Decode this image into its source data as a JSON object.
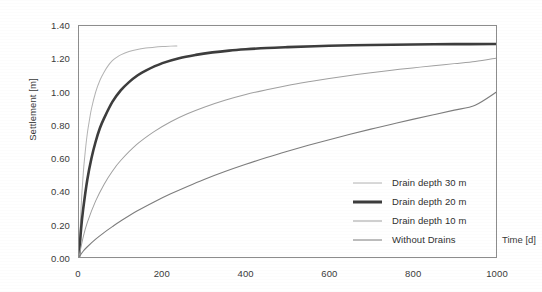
{
  "chart_data": {
    "type": "line",
    "title": "",
    "xlabel": "Time [d]",
    "ylabel": "Settlement [m]",
    "xlim": [
      0,
      1000
    ],
    "ylim": [
      0,
      1.4
    ],
    "xticks": [
      "0",
      "200",
      "400",
      "600",
      "800",
      "1000"
    ],
    "xtick_values": [
      0,
      200,
      400,
      600,
      800,
      1000
    ],
    "yticks": [
      "0.00",
      "0.20",
      "0.40",
      "0.60",
      "0.80",
      "1.00",
      "1.20",
      "1.40"
    ],
    "ytick_values": [
      0.0,
      0.2,
      0.4,
      0.6,
      0.8,
      1.0,
      1.2,
      1.4
    ],
    "grid": false,
    "legend_position": "lower right inside",
    "series": [
      {
        "name": "Drain depth 30 m",
        "color": "#b3b3b3",
        "width": 1.0,
        "x": [
          0,
          5,
          10,
          15,
          20,
          25,
          30,
          40,
          50,
          60,
          70,
          80,
          90,
          100,
          120,
          140,
          160,
          180,
          200,
          220,
          235
        ],
        "y": [
          0.0,
          0.3,
          0.5,
          0.64,
          0.75,
          0.83,
          0.9,
          1.0,
          1.07,
          1.12,
          1.16,
          1.19,
          1.21,
          1.225,
          1.245,
          1.258,
          1.266,
          1.271,
          1.275,
          1.278,
          1.279
        ]
      },
      {
        "name": "Drain depth 20 m",
        "color": "#3d3d3d",
        "width": 2.6,
        "x": [
          0,
          5,
          10,
          20,
          30,
          40,
          50,
          60,
          80,
          100,
          120,
          140,
          160,
          200,
          240,
          280,
          320,
          360,
          400,
          450,
          500,
          600,
          700,
          800,
          900,
          1000
        ],
        "y": [
          0.0,
          0.17,
          0.29,
          0.47,
          0.6,
          0.7,
          0.78,
          0.84,
          0.94,
          1.01,
          1.06,
          1.1,
          1.13,
          1.175,
          1.205,
          1.225,
          1.24,
          1.251,
          1.259,
          1.267,
          1.272,
          1.28,
          1.285,
          1.288,
          1.29,
          1.291
        ]
      },
      {
        "name": "Drain depth 10 m",
        "color": "#a0a0a0",
        "width": 1.0,
        "x": [
          0,
          10,
          20,
          40,
          60,
          80,
          100,
          140,
          180,
          220,
          260,
          300,
          350,
          400,
          450,
          500,
          550,
          600,
          650,
          700,
          750,
          800,
          850,
          900,
          950,
          1000
        ],
        "y": [
          0.0,
          0.12,
          0.21,
          0.34,
          0.44,
          0.52,
          0.585,
          0.685,
          0.76,
          0.82,
          0.868,
          0.908,
          0.95,
          0.985,
          1.014,
          1.04,
          1.062,
          1.082,
          1.1,
          1.117,
          1.132,
          1.146,
          1.159,
          1.172,
          1.185,
          1.205
        ]
      },
      {
        "name": "Without Drains",
        "color": "#7d7d7d",
        "width": 1.1,
        "x": [
          0,
          10,
          20,
          40,
          60,
          80,
          100,
          140,
          180,
          220,
          260,
          300,
          350,
          400,
          450,
          500,
          550,
          600,
          650,
          700,
          750,
          800,
          850,
          900,
          950,
          1000
        ],
        "y": [
          0.0,
          0.035,
          0.062,
          0.108,
          0.148,
          0.184,
          0.218,
          0.28,
          0.334,
          0.383,
          0.428,
          0.47,
          0.518,
          0.562,
          0.603,
          0.641,
          0.677,
          0.711,
          0.744,
          0.775,
          0.805,
          0.834,
          0.862,
          0.89,
          0.92,
          0.998
        ]
      }
    ]
  },
  "legend": {
    "items": [
      {
        "label": "Drain depth 30 m"
      },
      {
        "label": "Drain depth 20 m"
      },
      {
        "label": "Drain depth 10 m"
      },
      {
        "label": "Without Drains"
      }
    ]
  }
}
